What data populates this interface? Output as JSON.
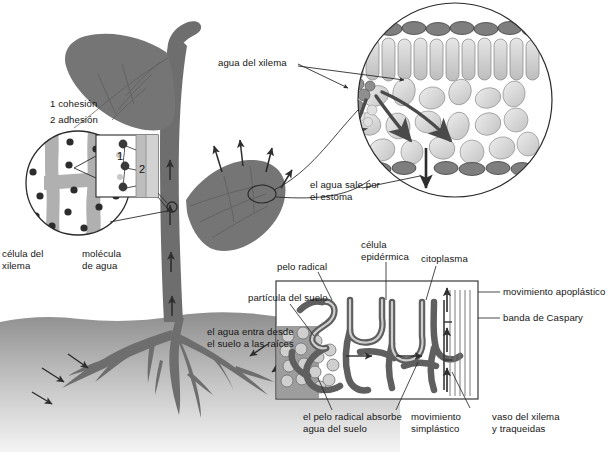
{
  "diagram": {
    "language": "es",
    "background": "#ffffff"
  },
  "colors": {
    "plant_dark": "#6b6b6b",
    "plant_mid": "#8a8a8a",
    "soil_top": "#8e8e8e",
    "soil_bottom": "#f2f2f2",
    "cell_light": "#d8d8d8",
    "cell_mid": "#c2c2c2",
    "cell_dark": "#7a7a7a",
    "outline": "#3a3a3a",
    "arrow": "#2e2e2e",
    "text": "#151515"
  },
  "labels": {
    "cohesion_key_line1": "1 cohesión",
    "cohesion_key_line2": "2 adhesión",
    "inset_num_1": "1",
    "inset_num_2": "2",
    "xylem_cell": "célula del\nxilema",
    "water_molecule": "molécula\nde agua",
    "xylem_water": "agua del xilema",
    "water_exits_stoma": "el agua sale por\nel estoma",
    "root_hair": "pelo radical",
    "epidermal_cell": "célula\nepidérmica",
    "cytoplasm": "citoplasma",
    "soil_particle": "partícula del suelo",
    "water_enters": "el agua entra desde\nel suelo a las raíces",
    "apoplastic_movement": "movimiento apoplástico",
    "casparian_strip": "banda de Caspary",
    "root_hair_absorbs": "el pelo radical absorbe\nagua del suelo",
    "symplastic_movement": "movimiento\nsimplástico",
    "xylem_vessel": "vaso del xilema\ny traqueidas"
  },
  "structures": {
    "leaf_inset": {
      "name": "corte transversal de la hoja",
      "layers": [
        "epidermis superior",
        "parénquima en empalizada",
        "parénquima esponjoso",
        "epidermis inferior"
      ],
      "arrow_count": 4,
      "stoma_arrow": "salida de agua"
    },
    "stem_inset": {
      "name": "columna de agua en el xilema",
      "annotations": [
        "cohesión entre moléculas de agua",
        "adhesión a la pared celular"
      ]
    },
    "root_inset": {
      "name": "corte de la raíz",
      "pathways": [
        "apoplástica",
        "simplástica"
      ],
      "features": [
        "pelo radical",
        "célula epidérmica",
        "citoplasma",
        "banda de Caspary",
        "vaso del xilema"
      ]
    },
    "whole_plant": {
      "leaves": 2,
      "transpiration_arrows": 4,
      "stem_flow_arrows": 4,
      "soil_uptake_arrows": 6
    }
  }
}
